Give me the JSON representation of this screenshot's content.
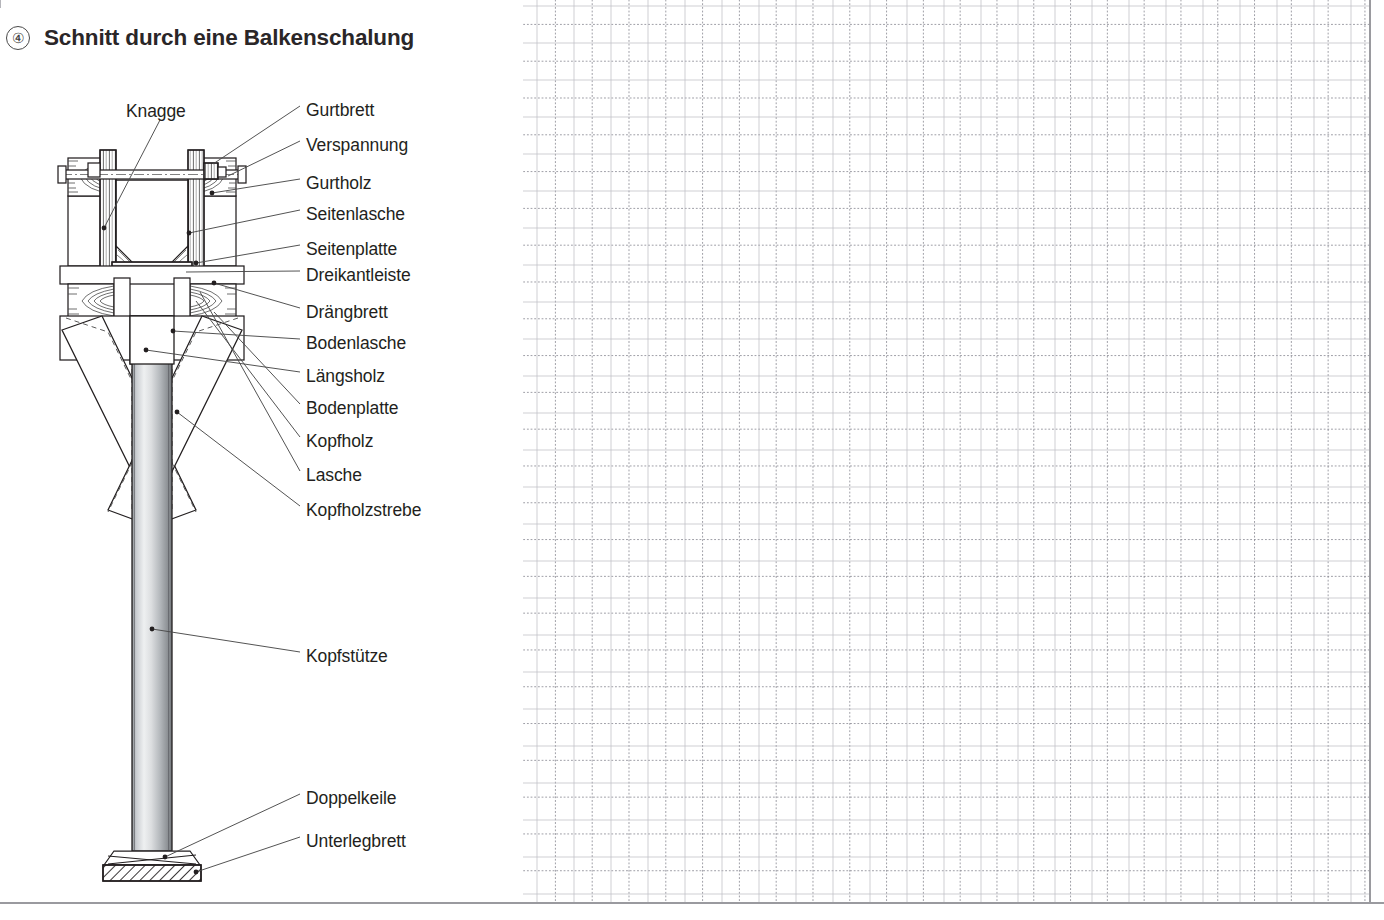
{
  "page": {
    "figure_number": "④",
    "title": "Schnitt durch eine Balkenschalung",
    "background_color": "#ffffff",
    "line_color": "#231f20",
    "grid_color": "#8c8c96",
    "frame_color": "#9a9a9f"
  },
  "labels": [
    {
      "id": "knagge",
      "text": "Knagge",
      "x": 126,
      "y": 103
    },
    {
      "id": "gurtbrett",
      "text": "Gurtbrett",
      "x": 306,
      "y": 102
    },
    {
      "id": "verspannung",
      "text": "Verspannung",
      "x": 306,
      "y": 137
    },
    {
      "id": "gurtholz",
      "text": "Gurtholz",
      "x": 306,
      "y": 175
    },
    {
      "id": "seitenlasche",
      "text": "Seitenlasche",
      "x": 306,
      "y": 206
    },
    {
      "id": "seitenplatte",
      "text": "Seitenplatte",
      "x": 306,
      "y": 241
    },
    {
      "id": "dreikantleiste",
      "text": "Dreikantleiste",
      "x": 306,
      "y": 267
    },
    {
      "id": "draengbrett",
      "text": "Drängbrett",
      "x": 306,
      "y": 304
    },
    {
      "id": "bodenlasche",
      "text": "Bodenlasche",
      "x": 306,
      "y": 335
    },
    {
      "id": "laengsholz",
      "text": "Längsholz",
      "x": 306,
      "y": 368
    },
    {
      "id": "bodenplatte",
      "text": "Bodenplatte",
      "x": 306,
      "y": 400
    },
    {
      "id": "kopfholz",
      "text": "Kopfholz",
      "x": 306,
      "y": 433
    },
    {
      "id": "lasche",
      "text": "Lasche",
      "x": 306,
      "y": 467
    },
    {
      "id": "kopfholzstrebe",
      "text": "Kopfholzstrebe",
      "x": 306,
      "y": 502
    },
    {
      "id": "kopfstuetze",
      "text": "Kopfstütze",
      "x": 306,
      "y": 648
    },
    {
      "id": "doppelkeile",
      "text": "Doppelkeile",
      "x": 306,
      "y": 790
    },
    {
      "id": "unterlegbrett",
      "text": "Unterlegbrett",
      "x": 306,
      "y": 833
    }
  ],
  "leader_lines": [
    {
      "id": "knagge",
      "from": [
        160,
        120
      ],
      "to": [
        104,
        228
      ]
    },
    {
      "id": "gurtbrett",
      "from": [
        300,
        106
      ],
      "to": [
        212,
        163
      ]
    },
    {
      "id": "verspannung",
      "from": [
        300,
        141
      ],
      "to": [
        226,
        179
      ]
    },
    {
      "id": "gurtholz",
      "from": [
        300,
        179
      ],
      "to": [
        212,
        193
      ]
    },
    {
      "id": "seitenlasche",
      "from": [
        300,
        210
      ],
      "to": [
        190,
        233
      ]
    },
    {
      "id": "seitenplatte",
      "from": [
        300,
        245
      ],
      "to": [
        196,
        265
      ]
    },
    {
      "id": "dreikantleiste",
      "from": [
        300,
        271
      ],
      "to": [
        190,
        273
      ]
    },
    {
      "id": "draengbrett",
      "from": [
        300,
        308
      ],
      "to": [
        216,
        283
      ]
    },
    {
      "id": "bodenlasche",
      "from": [
        300,
        339
      ],
      "to": [
        176,
        330
      ]
    },
    {
      "id": "laengsholz",
      "from": [
        300,
        372
      ],
      "to": [
        144,
        348
      ]
    },
    {
      "id": "bodenplatte",
      "from": [
        300,
        404
      ],
      "to": [
        216,
        310
      ]
    },
    {
      "id": "kopfholz",
      "from": [
        300,
        437
      ],
      "to": [
        196,
        300
      ]
    },
    {
      "id": "lasche",
      "from": [
        300,
        471
      ],
      "to": [
        200,
        292
      ]
    },
    {
      "id": "kopfholzstrebe",
      "from": [
        300,
        506
      ],
      "to": [
        176,
        410
      ]
    },
    {
      "id": "kopfstuetze",
      "from": [
        300,
        652
      ],
      "to": [
        150,
        628
      ]
    },
    {
      "id": "doppelkeile",
      "from": [
        300,
        794
      ],
      "to": [
        163,
        856
      ]
    },
    {
      "id": "unterlegbrett",
      "from": [
        300,
        837
      ],
      "to": [
        196,
        872
      ]
    }
  ],
  "drawing": {
    "name": "beam-formwork-cross-section",
    "prop": {
      "name": "Kopfstütze",
      "x": 132,
      "top": 352,
      "bottom": 851,
      "width": 40,
      "fill_light": "#f2f3f4",
      "fill_mid": "#b9bcc0",
      "fill_dark": "#7f8387"
    },
    "underlay_board": {
      "name": "Unterlegbrett",
      "x": 111,
      "y": 865,
      "width": 82,
      "height": 15
    },
    "wedges": {
      "name": "Doppelkeile",
      "x": 118,
      "y": 851,
      "width": 68,
      "height": 14
    }
  }
}
